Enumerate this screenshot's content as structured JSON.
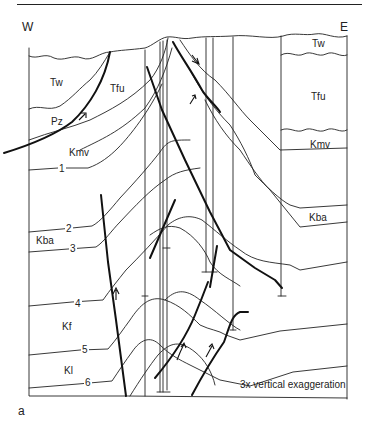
{
  "figure": {
    "panel_label": "a",
    "directions": {
      "west": "W",
      "east": "E"
    },
    "note": "3x vertical exaggeration",
    "units_west": [
      {
        "id": "tw_w",
        "label": "Tw"
      },
      {
        "id": "tfu_w",
        "label": "Tfu"
      },
      {
        "id": "pz",
        "label": "Pz"
      },
      {
        "id": "kmv_w",
        "label": "Kmv"
      },
      {
        "id": "kba_w",
        "label": "Kba"
      },
      {
        "id": "kf",
        "label": "Kf"
      },
      {
        "id": "kl",
        "label": "Kl"
      }
    ],
    "units_east": [
      {
        "id": "tw_e",
        "label": "Tw"
      },
      {
        "id": "tfu_e",
        "label": "Tfu"
      },
      {
        "id": "kmv_e",
        "label": "Kmv"
      },
      {
        "id": "kba_e",
        "label": "Kba"
      }
    ],
    "horizon_numbers": [
      "1",
      "2",
      "3",
      "4",
      "5",
      "6"
    ],
    "colors": {
      "line": "#222222",
      "background": "#ffffff"
    }
  }
}
